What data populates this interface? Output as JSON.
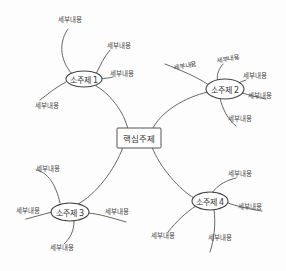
{
  "diagram": {
    "type": "mind-map",
    "style": "hand-drawn",
    "colors": {
      "line": "#555555",
      "text": "#333333",
      "background": "#fdfdfd"
    },
    "central": {
      "label": "핵심주제",
      "x": 138,
      "y": 138
    },
    "subtopics": [
      {
        "label": "소주제 1",
        "x": 84,
        "y": 79,
        "details": [
          {
            "label": "세부내용",
            "x": 70,
            "y": 19
          },
          {
            "label": "세부내용",
            "x": 119,
            "y": 45
          },
          {
            "label": "세부내용",
            "x": 122,
            "y": 73
          },
          {
            "label": "세부내용",
            "x": 47,
            "y": 105
          }
        ]
      },
      {
        "label": "소주제 2",
        "x": 225,
        "y": 89,
        "details": [
          {
            "label": "세부내용",
            "x": 185,
            "y": 65
          },
          {
            "label": "세부내용",
            "x": 228,
            "y": 58
          },
          {
            "label": "세부내용",
            "x": 255,
            "y": 75
          },
          {
            "label": "세부내용",
            "x": 260,
            "y": 95
          },
          {
            "label": "세부내용",
            "x": 240,
            "y": 118
          }
        ]
      },
      {
        "label": "소주제 3",
        "x": 70,
        "y": 212,
        "details": [
          {
            "label": "세부내용",
            "x": 48,
            "y": 168
          },
          {
            "label": "세부내용",
            "x": 28,
            "y": 210
          },
          {
            "label": "세부내용",
            "x": 117,
            "y": 211
          },
          {
            "label": "세부내용",
            "x": 62,
            "y": 247
          }
        ]
      },
      {
        "label": "소주제 4",
        "x": 210,
        "y": 201,
        "details": [
          {
            "label": "세부내용",
            "x": 240,
            "y": 173
          },
          {
            "label": "세부내용",
            "x": 250,
            "y": 206
          },
          {
            "label": "세부내용",
            "x": 163,
            "y": 235
          },
          {
            "label": "세부내용",
            "x": 220,
            "y": 237
          }
        ]
      }
    ]
  }
}
